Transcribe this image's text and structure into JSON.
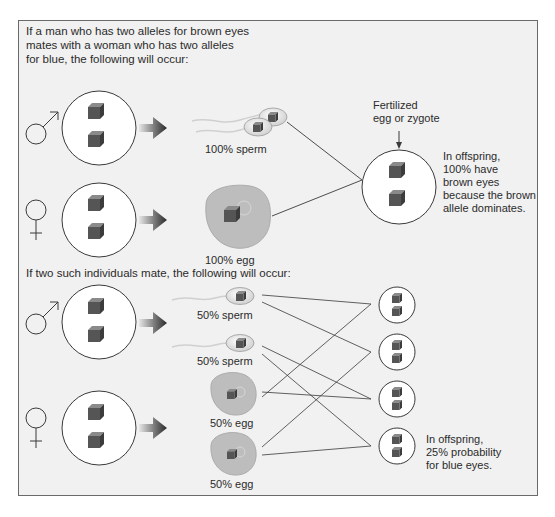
{
  "intro": {
    "line1": "If a man who has two alleles for brown eyes",
    "line2": "mates with a woman who has two alleles",
    "line3": "for blue, the following will occur:"
  },
  "top_section": {
    "sperm_label": "100% sperm",
    "egg_label": "100% egg",
    "zygote_label_line1": "Fertilized",
    "zygote_label_line2": "egg or zygote",
    "result_line1": "In offspring,",
    "result_line2": "100% have",
    "result_line3": "brown eyes",
    "result_line4": "because the brown",
    "result_line5": "allele dominates."
  },
  "second_heading": "If two such individuals mate, the following will occur:",
  "bottom_section": {
    "sperm1_label": "50% sperm",
    "sperm2_label": "50% sperm",
    "egg1_label": "50% egg",
    "egg2_label": "50% egg",
    "result_line1": "In offspring,",
    "result_line2": "25% probability",
    "result_line3": "for blue eyes."
  },
  "symbols": {
    "male": "male-symbol",
    "female": "female-symbol"
  },
  "colors": {
    "background": "#f1f1f1",
    "frame_border": "#6a6a6a",
    "cube_front": "#555555",
    "cube_top": "#8a8a8a",
    "cube_side": "#3c3c3c",
    "egg_fill": "#bdbdbd",
    "line": "#3a3a3a"
  }
}
